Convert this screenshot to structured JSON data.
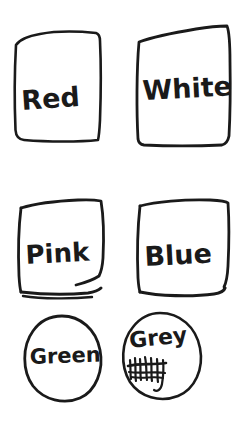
{
  "canvas": {
    "width": 240,
    "height": 435,
    "background_color": "#ffffff",
    "ink_color": "#1a1a1a",
    "medium": "hand-drawn marker sketch"
  },
  "swatches": [
    {
      "id": "red",
      "label": "Red",
      "shape": "rectangle",
      "row": 1,
      "column": 1,
      "label_x": 22,
      "label_y": 110,
      "label_size": 27,
      "label_rotation": -4
    },
    {
      "id": "white",
      "label": "White",
      "shape": "rectangle",
      "row": 1,
      "column": 2,
      "label_x": 143,
      "label_y": 100,
      "label_size": 27,
      "label_rotation": -3
    },
    {
      "id": "pink",
      "label": "Pink",
      "shape": "rectangle",
      "row": 2,
      "column": 1,
      "label_x": 26,
      "label_y": 264,
      "label_size": 26,
      "label_rotation": -3
    },
    {
      "id": "blue",
      "label": "Blue",
      "shape": "rectangle",
      "row": 2,
      "column": 2,
      "label_x": 145,
      "label_y": 266,
      "label_size": 27,
      "label_rotation": -3
    },
    {
      "id": "green",
      "label": "Green",
      "shape": "ellipse",
      "row": 3,
      "column": 1,
      "label_x": 30,
      "label_y": 364,
      "label_size": 21,
      "label_rotation": -2
    },
    {
      "id": "grey",
      "label": "Grey",
      "shape": "ellipse",
      "row": 3,
      "column": 2,
      "label_x": 130,
      "label_y": 348,
      "label_size": 22,
      "label_rotation": -6
    }
  ],
  "annotations": {
    "grey_crossed_out": {
      "description": "scribbled-out word under Grey",
      "visible_text": "",
      "x": 128,
      "y": 372
    }
  }
}
